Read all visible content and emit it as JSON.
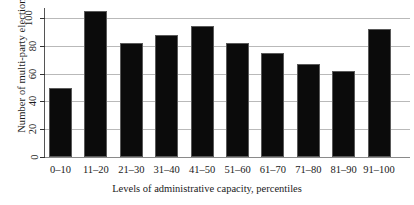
{
  "chart_data": {
    "type": "bar",
    "title": "",
    "xlabel": "Levels of administrative capacity, percentiles",
    "ylabel": "Number of multi-party elections",
    "categories": [
      "0–10",
      "11–20",
      "21–30",
      "31–40",
      "41–50",
      "51–60",
      "61–70",
      "71–80",
      "81–90",
      "91–100"
    ],
    "values": [
      50,
      105,
      82,
      88,
      94,
      82,
      75,
      67,
      62,
      92
    ],
    "ylim": [
      0,
      108
    ],
    "yticks": [
      0,
      20,
      40,
      60,
      80,
      100
    ],
    "ytick_labels": [
      "0",
      "20",
      "40",
      "60",
      "80",
      "100"
    ],
    "grid": "horizontal",
    "legend": "none",
    "bar_color": "#0b0b0b"
  }
}
